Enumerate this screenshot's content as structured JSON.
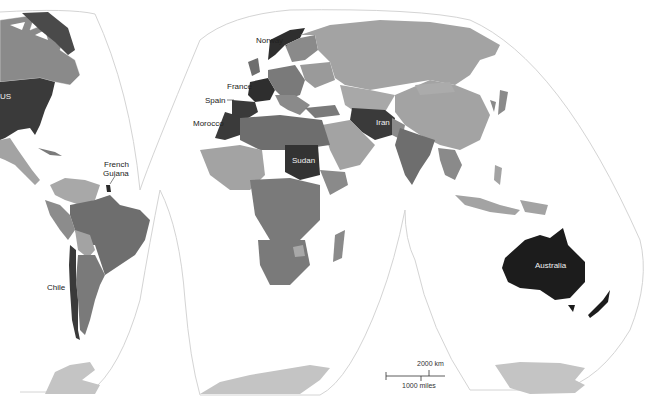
{
  "map": {
    "type": "choropleth world map",
    "projection": "interrupted (Goode homolosine style)",
    "colors": {
      "background": "#ffffff",
      "outline": "#cfcfcf",
      "tier_lightest": "#bdbdbd",
      "tier_light": "#a3a3a3",
      "tier_mid": "#8a8a8a",
      "tier_dark": "#6e6e6e",
      "tier_darker": "#4a4a4a",
      "tier_darkest": "#1c1c1c",
      "antarctica": "#c4c4c4"
    },
    "labels": {
      "us": "US",
      "norway": "Norway",
      "france": "France",
      "spain": "Spain",
      "morocco": "Morocco",
      "french_guiana": "French\nGuiana",
      "french_guiana_line1": "French",
      "french_guiana_line2": "Guiana",
      "iran": "Iran",
      "sudan": "Sudan",
      "chile": "Chile",
      "australia": "Australia"
    },
    "scale_bar": {
      "km_label": "2000 km",
      "miles_label": "1000 miles"
    }
  }
}
